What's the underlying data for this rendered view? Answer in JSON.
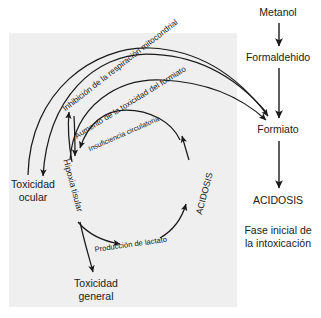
{
  "diagram": {
    "background_color": "#ffffff",
    "panel_color": "#efefef",
    "stroke_color": "#1a1a1a",
    "cycle": {
      "nodes": [
        {
          "id": "toxicidad-ocular",
          "label": "Toxicidad\nocular"
        },
        {
          "id": "toxicidad-general",
          "label": "Toxicidad\ngeneral"
        }
      ],
      "arc_labels": [
        {
          "id": "inhibicion-respiracion",
          "text": "Inhibición de la respiración mitocondrial"
        },
        {
          "id": "aumento-toxicidad-formiato",
          "text": "Aumento de la toxicidad del formiato"
        },
        {
          "id": "insuficiencia-circulatoria",
          "text": "Insuficiencia circulatoria"
        },
        {
          "id": "produccion-lactato",
          "text": "Producción de lactato"
        }
      ],
      "vertical_labels": [
        {
          "id": "hipoxia-tisular",
          "text": "Hipoxia tisular"
        },
        {
          "id": "acidosis-cycle",
          "text": "ACIDOSIS"
        }
      ]
    },
    "pathway": {
      "steps": [
        {
          "id": "metanol",
          "label": "Metanol"
        },
        {
          "id": "formaldehido",
          "label": "Formaldehido"
        },
        {
          "id": "formiato",
          "label": "Formiato"
        },
        {
          "id": "acidosis",
          "label": "ACIDOSIS"
        }
      ],
      "caption": "Fase inicial de\nla intoxicación"
    }
  }
}
